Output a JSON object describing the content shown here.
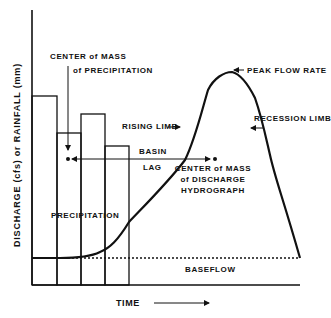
{
  "diagram": {
    "title": "Discharge Hydrograph",
    "y_axis_label": "DISCHARGE (cfs) or RAINFALL (mm)",
    "x_axis_label": "TIME",
    "labels": {
      "center_precip_line1": "CENTER of MASS",
      "center_precip_line2": "of PRECIPITATION",
      "peak_flow": "PEAK FLOW RATE",
      "rising_limb": "RISING LIMB",
      "recession_limb": "RECESSION LIMB",
      "basin": "BASIN",
      "lag": "LAG",
      "center_discharge_line1": "CENTER of MASS",
      "center_discharge_line2": "of DISCHARGE",
      "center_discharge_line3": "HYDROGRAPH",
      "precipitation": "PRECIPITATION",
      "baseflow": "BASEFLOW"
    },
    "precipitation_bars": [
      {
        "x0": 32,
        "x1": 57,
        "top": 96
      },
      {
        "x0": 57,
        "x1": 81,
        "top": 133
      },
      {
        "x0": 81,
        "x1": 105,
        "top": 114
      },
      {
        "x0": 105,
        "x1": 129,
        "top": 146
      }
    ],
    "colors": {
      "line": "#111111",
      "background": "#ffffff"
    }
  }
}
